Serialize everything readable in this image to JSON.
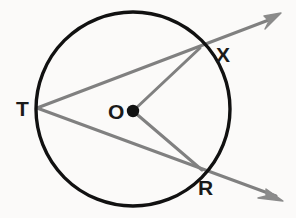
{
  "figure": {
    "background_color": "#fbfaf9",
    "circle_color": "#111111",
    "line_color": "#808080",
    "point_color": "#111111",
    "label_color": "#1a1a1a"
  },
  "labels": {
    "center": "O",
    "left_point": "T",
    "upper_right_point": "X",
    "lower_right_point": "R"
  },
  "geometry": {
    "circle": {
      "cx": 133,
      "cy": 109,
      "r": 97,
      "stroke_width": 3.4
    },
    "center_dot": {
      "cx": 133,
      "cy": 111,
      "r": 6
    },
    "points": {
      "T": {
        "x": 37,
        "y": 108
      },
      "O": {
        "x": 133,
        "y": 111
      },
      "X": {
        "x": 200,
        "y": 48
      },
      "R": {
        "x": 202,
        "y": 170
      }
    },
    "rays": [
      {
        "name": "ray-T-X",
        "from": "T",
        "through": "X",
        "tip_x": 281,
        "tip_y": 13
      },
      {
        "name": "ray-T-R",
        "from": "T",
        "through": "R",
        "tip_x": 283,
        "tip_y": 201
      }
    ],
    "radii": [
      {
        "name": "radius-O-X",
        "from": "O",
        "to": "X"
      },
      {
        "name": "radius-O-R",
        "from": "O",
        "to": "R"
      }
    ],
    "line_stroke_width": 3.0,
    "arrow_head_size": 13
  }
}
